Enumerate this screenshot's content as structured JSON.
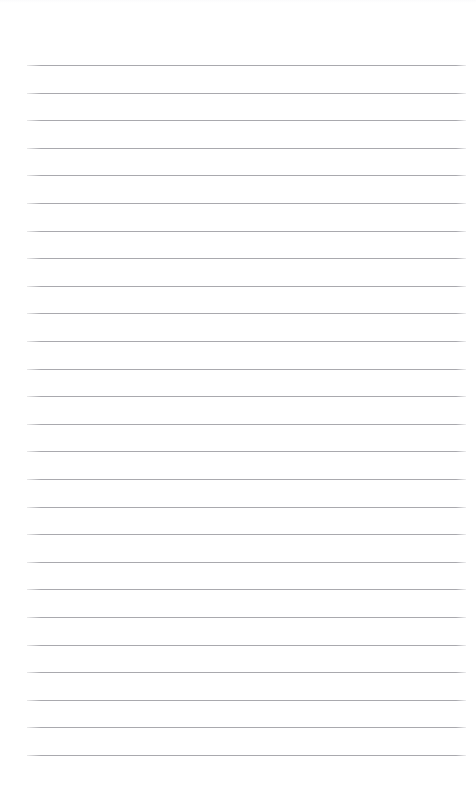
{
  "page": {
    "kind": "lined-paper-sheet",
    "width": 476,
    "height": 794,
    "background_color": "#ffffff",
    "content_text": "",
    "top_margin_px": 65,
    "bottom_margin_px": 39,
    "left_margin_px": 27,
    "right_margin_px": 10
  },
  "ruling": {
    "line_color": "#a9a9ae",
    "line_thickness_px": 1,
    "line_spacing_px": 27.6,
    "first_line_y": 65,
    "last_line_y": 755,
    "line_left_x": 27,
    "line_right_x": 466,
    "line_width_px": 439,
    "line_count": 26,
    "line_y_positions": [
      65,
      92.6,
      120.2,
      147.8,
      175.4,
      203,
      230.6,
      258.2,
      285.8,
      313.4,
      341,
      368.6,
      396.2,
      423.8,
      451.4,
      479,
      506.6,
      534.2,
      561.8,
      589.4,
      617,
      644.6,
      672.2,
      699.8,
      727.4,
      755
    ]
  },
  "edge_artifact": {
    "color": "#fbfbfc",
    "height_px": 3
  }
}
